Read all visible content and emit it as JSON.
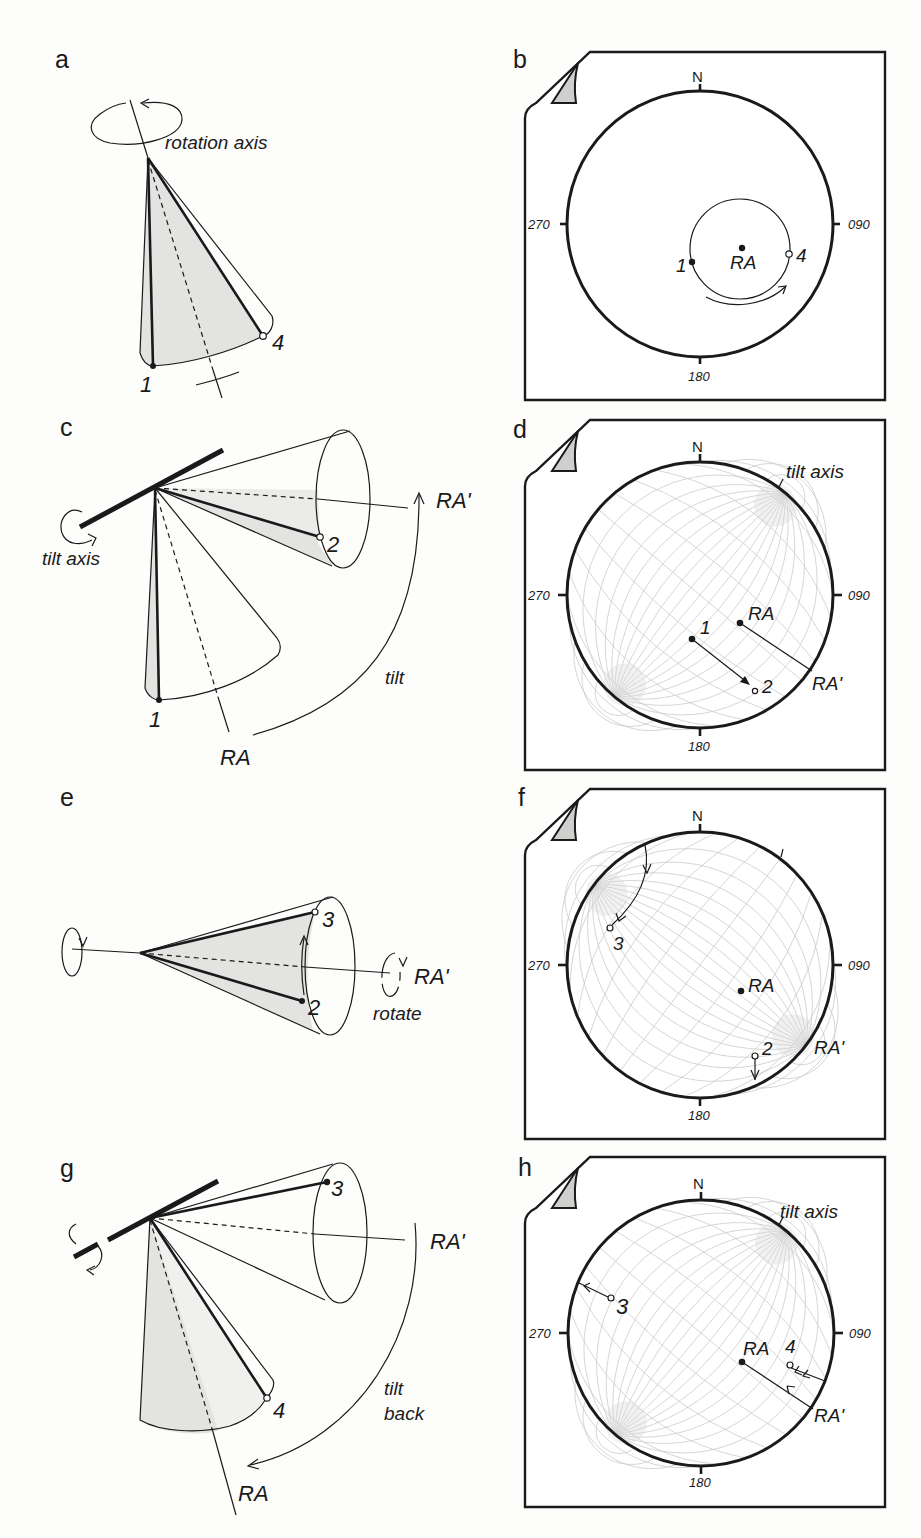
{
  "figure": {
    "panels": {
      "a": {
        "letter": "a",
        "rotation_axis_label": "rotation axis",
        "point_labels": [
          "1",
          "4"
        ]
      },
      "b": {
        "letter": "b",
        "compass": {
          "north": "N",
          "east": "090",
          "south": "180",
          "west": "270"
        },
        "center_label": "RA",
        "point_labels": [
          "1",
          "4"
        ],
        "grid": false
      },
      "c": {
        "letter": "c",
        "tilt_axis_label": "tilt axis",
        "rotated_axis_label": "RA'",
        "original_axis_label": "RA",
        "motion_label": "tilt",
        "point_labels": [
          "1",
          "2"
        ]
      },
      "d": {
        "letter": "d",
        "compass": {
          "north": "N",
          "east": "090",
          "south": "180",
          "west": "270"
        },
        "tilt_axis_label": "tilt axis",
        "ra_label": "RA",
        "ra_prime_label": "RA'",
        "point_labels": [
          "1",
          "2"
        ],
        "grid": true,
        "grid_rotation_deg": 40
      },
      "e": {
        "letter": "e",
        "rotated_axis_label": "RA'",
        "motion_label": "rotate",
        "point_labels": [
          "3",
          "2"
        ]
      },
      "f": {
        "letter": "f",
        "compass": {
          "north": "N",
          "east": "090",
          "south": "180",
          "west": "270"
        },
        "ra_label": "RA",
        "ra_prime_label": "RA'",
        "point_labels": [
          "3",
          "2"
        ],
        "grid": true,
        "grid_rotation_deg": -53
      },
      "g": {
        "letter": "g",
        "rotated_axis_label": "RA'",
        "original_axis_label": "RA",
        "motion_label_line1": "tilt",
        "motion_label_line2": "back",
        "point_labels": [
          "3",
          "4"
        ]
      },
      "h": {
        "letter": "h",
        "compass": {
          "north": "N",
          "east": "090",
          "south": "180",
          "west": "270"
        },
        "tilt_axis_label": "tilt axis",
        "ra_label": "RA",
        "ra_prime_label": "RA'",
        "point_labels": [
          "3",
          "4"
        ],
        "grid": true,
        "grid_rotation_deg": 40
      }
    },
    "colors": {
      "ink": "#1a1a1a",
      "shade": "#e3e3e1",
      "grid": "#c9c9c9",
      "paper": "#fdfdfb"
    }
  }
}
